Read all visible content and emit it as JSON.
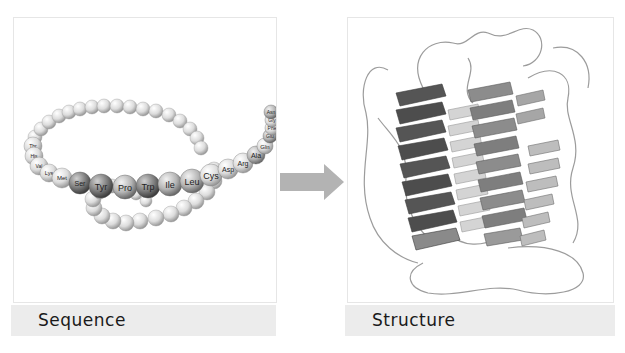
{
  "figure": {
    "left_panel": {
      "caption": "Sequence",
      "residue_labels": [
        "Thr",
        "His",
        "Val",
        "Lys",
        "Met",
        "Ser",
        "Tyr",
        "Pro",
        "Trp",
        "Ile",
        "Leu",
        "Cys",
        "Asp",
        "Arg",
        "Ala",
        "Gln",
        "Glu",
        "Phe",
        "Gly",
        "Asn"
      ]
    },
    "right_panel": {
      "caption": "Structure"
    },
    "arrow": {
      "direction": "right",
      "meaning": "folding"
    },
    "colors": {
      "panel_border": "#e6e6e6",
      "caption_band": "#ececec",
      "arrow": "#b3b3b3",
      "bead_light": "#e8e8e8",
      "bead_dark": "#6e6e6e"
    }
  }
}
